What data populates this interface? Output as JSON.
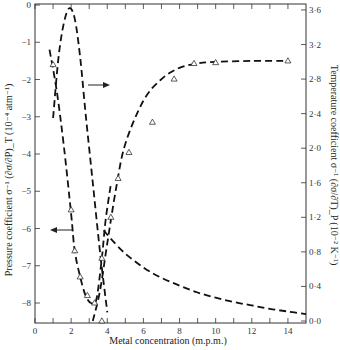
{
  "chart_data": {
    "type": "line",
    "title": "",
    "xlabel": "Metal concentration (m.p.m.)",
    "ylabel_left": "Pressure coefficient σ⁻¹ (∂σ/∂P)_T (10⁻⁴ atm⁻¹)",
    "ylabel_right": "Temperature coefficient σ⁻¹ (∂σ/∂T)_P (10⁻² K⁻¹)",
    "xlim": [
      0,
      15
    ],
    "ylim_left": [
      -8.5,
      0
    ],
    "ylim_right": [
      0.0,
      3.7
    ],
    "x_ticks": [
      0,
      2,
      4,
      6,
      8,
      10,
      12,
      14
    ],
    "x_minor_ticks": [
      1,
      3,
      5,
      7,
      9,
      11,
      13
    ],
    "y_left_ticks": [
      0,
      -1,
      -2,
      -3,
      -4,
      -5,
      -6,
      -7,
      -8
    ],
    "y_right_ticks": [
      "0·0",
      "0·4",
      "0·8",
      "1·2",
      "1·6",
      "2·0",
      "2·4",
      "2·8",
      "3·2",
      "3·6"
    ],
    "grid": false,
    "legend": "none (arrows indicate axis)",
    "series": [
      {
        "name": "Pressure coefficient (left axis)",
        "axis": "left",
        "style": "dashed",
        "arrow": "points left",
        "curve": {
          "x": [
            0.8,
            1.2,
            1.6,
            2.0,
            2.2,
            2.5,
            2.8,
            3.1,
            3.4,
            3.7,
            3.9,
            4.2
          ],
          "y": [
            -1.2,
            -2.3,
            -3.8,
            -5.6,
            -6.6,
            -7.3,
            -7.8,
            -8.0,
            -7.9,
            -6.8,
            -5.8,
            -4.8
          ]
        },
        "points": {
          "x": [
            1.0,
            2.0,
            2.2,
            2.5,
            2.9,
            3.3,
            3.7
          ],
          "y": [
            -1.6,
            -5.5,
            -6.6,
            -7.3,
            -7.8,
            -8.0,
            -6.8
          ]
        }
      },
      {
        "name": "Temperature coefficient (left-peak branch, right axis)",
        "axis": "right",
        "style": "dashed",
        "arrow": "points right",
        "curve": {
          "x": [
            1.0,
            1.3,
            1.6,
            1.9,
            2.2,
            2.5,
            2.8,
            3.2,
            3.6,
            4.0
          ],
          "y": [
            2.35,
            3.05,
            3.45,
            3.62,
            3.5,
            3.05,
            2.4,
            1.6,
            0.8,
            0.1
          ]
        }
      },
      {
        "name": "Temperature coefficient (rising branch, right axis)",
        "axis": "right",
        "style": "dashed",
        "curve": {
          "x": [
            3.2,
            3.6,
            4.0,
            4.5,
            5.0,
            6.0,
            7.0,
            8.0,
            9.0,
            10.0,
            12.0,
            14.0
          ],
          "y": [
            0.0,
            0.35,
            0.9,
            1.55,
            2.05,
            2.55,
            2.8,
            2.93,
            2.98,
            3.0,
            3.01,
            3.01
          ]
        },
        "points": {
          "x": [
            3.7,
            4.2,
            4.6,
            5.2,
            6.5,
            7.7,
            8.8,
            10.0,
            14.0
          ],
          "y": [
            0.0,
            1.2,
            1.65,
            1.95,
            2.3,
            2.8,
            2.98,
            2.99,
            3.01
          ]
        }
      },
      {
        "name": "Pressure-side decaying curve",
        "axis": "right",
        "style": "dashed",
        "curve": {
          "x": [
            3.8,
            4.2,
            5.0,
            6.0,
            7.0,
            8.0,
            9.0,
            10.0,
            11.0,
            12.0,
            13.0,
            14.0,
            15.0
          ],
          "y": [
            1.05,
            0.95,
            0.78,
            0.62,
            0.5,
            0.41,
            0.33,
            0.27,
            0.22,
            0.18,
            0.14,
            0.11,
            0.08
          ]
        }
      }
    ]
  },
  "labels": {
    "xlabel": "Metal concentration (m.p.m.)",
    "ylabel_left": "Pressure coefficient σ⁻¹ (∂σ/∂P)_T (10⁻⁴ atm⁻¹)",
    "ylabel_right": "Temperature coefficient σ⁻¹ (∂σ/∂T)_P (10⁻² K⁻¹)"
  }
}
